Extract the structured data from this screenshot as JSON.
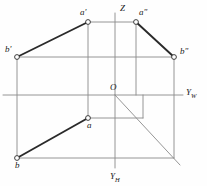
{
  "figure": {
    "width": 207,
    "height": 186,
    "background_color": "#fefefe",
    "stroke_color_thin": "#8a8a8a",
    "stroke_color_thick": "#2a2a2a",
    "point_fill": "#ffffff",
    "label_color": "#1a1a1a"
  },
  "axes": [
    {
      "name": "Z",
      "label": "Z",
      "label_x": 120,
      "label_y": 4,
      "orientation": "vertical-up"
    },
    {
      "name": "YW",
      "label": "Y",
      "sub": "W",
      "label_x": 186,
      "label_y": 88,
      "orientation": "horizontal-right"
    },
    {
      "name": "YH",
      "label": "Y",
      "sub": "H",
      "label_x": 110,
      "label_y": 172,
      "orientation": "vertical-down"
    }
  ],
  "origin": {
    "name": "O",
    "label": "O",
    "x": 115,
    "y": 95,
    "label_x": 110,
    "label_y": 83
  },
  "points": [
    {
      "id": "a-prime",
      "label": "a",
      "prime": "'",
      "x": 88,
      "y": 22,
      "label_x": 80,
      "label_y": 8,
      "r": 2.4
    },
    {
      "id": "a-dprime",
      "label": "a",
      "prime": "\"",
      "x": 136,
      "y": 22,
      "label_x": 139,
      "label_y": 8,
      "r": 2.4
    },
    {
      "id": "b-prime",
      "label": "b",
      "prime": "'",
      "x": 17,
      "y": 57,
      "label_x": 5,
      "label_y": 45,
      "r": 2.4
    },
    {
      "id": "b-dprime",
      "label": "b",
      "prime": "\"",
      "x": 174,
      "y": 57,
      "label_x": 180,
      "label_y": 47,
      "r": 2.4
    },
    {
      "id": "a",
      "label": "a",
      "prime": "",
      "x": 88,
      "y": 118,
      "label_x": 87,
      "label_y": 121,
      "r": 2.4
    },
    {
      "id": "b",
      "label": "b",
      "prime": "",
      "x": 17,
      "y": 158,
      "label_x": 15,
      "label_y": 161,
      "r": 2.4
    }
  ],
  "thick_lines": [
    {
      "id": "a-prime-to-b-prime",
      "x1": 88,
      "y1": 22,
      "x2": 17,
      "y2": 57
    },
    {
      "id": "a-dprime-to-b-dprime",
      "x1": 136,
      "y1": 22,
      "x2": 174,
      "y2": 57
    },
    {
      "id": "a-to-b",
      "x1": 88,
      "y1": 118,
      "x2": 17,
      "y2": 158
    }
  ],
  "thin_lines": [
    {
      "id": "z-axis",
      "x1": 115,
      "y1": 13,
      "x2": 115,
      "y2": 95
    },
    {
      "id": "yh-axis",
      "x1": 115,
      "y1": 95,
      "x2": 115,
      "y2": 168
    },
    {
      "id": "yw-axis",
      "x1": 3,
      "y1": 95,
      "x2": 183,
      "y2": 95
    },
    {
      "id": "bisector-diagonal",
      "x1": 115,
      "y1": 95,
      "x2": 180,
      "y2": 165
    },
    {
      "id": "top-edge-a-prime-a-dprime",
      "x1": 88,
      "y1": 22,
      "x2": 136,
      "y2": 22
    },
    {
      "id": "mid-edge-b-prime-b-dprime",
      "x1": 17,
      "y1": 57,
      "x2": 174,
      "y2": 57
    },
    {
      "id": "bottom-edge-b-to-right",
      "x1": 17,
      "y1": 158,
      "x2": 174,
      "y2": 158
    },
    {
      "id": "vertical-left-b",
      "x1": 17,
      "y1": 57,
      "x2": 17,
      "y2": 158
    },
    {
      "id": "vertical-a-column",
      "x1": 88,
      "y1": 22,
      "x2": 88,
      "y2": 118
    },
    {
      "id": "vertical-a-dprime-column",
      "x1": 136,
      "y1": 22,
      "x2": 136,
      "y2": 95
    },
    {
      "id": "vertical-right-b-dprime",
      "x1": 174,
      "y1": 57,
      "x2": 174,
      "y2": 158
    },
    {
      "id": "horizontal-a-to-diagonal",
      "x1": 88,
      "y1": 118,
      "x2": 143,
      "y2": 118
    },
    {
      "id": "vertical-143-to-axis",
      "x1": 143,
      "y1": 95,
      "x2": 143,
      "y2": 118
    }
  ]
}
